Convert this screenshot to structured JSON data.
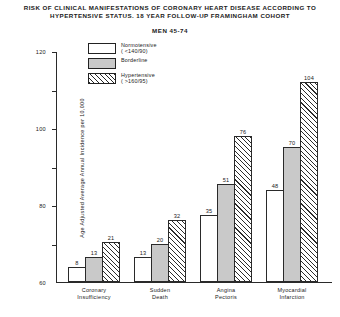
{
  "chart_data": {
    "type": "bar",
    "title": "RISK OF CLINICAL MANIFESTATIONS OF CORONARY HEART DISEASE ACCORDING TO HYPERTENSIVE STATUS.  18 YEAR FOLLOW-UP FRAMINGHAM COHORT",
    "title_line1": "RISK OF CLINICAL MANIFESTATIONS OF CORONARY HEART DISEASE ACCORDING TO",
    "title_line2": "HYPERTENSIVE STATUS.  18 YEAR FOLLOW-UP FRAMINGHAM COHORT",
    "subtitle": "MEN 45-74",
    "xlabel": "",
    "ylabel": "Age Adjusted Average Annual Incidence per 10,000",
    "ylim": [
      0,
      120
    ],
    "yticks": [
      0,
      20,
      40,
      60,
      80,
      100,
      120
    ],
    "ytick_labels": [
      "0",
      "20",
      "40",
      "60",
      "80",
      "100",
      "120"
    ],
    "grid": false,
    "legend_position": "top-left-inside",
    "categories": [
      "Coronary Insufficiency",
      "Sudden Death",
      "Angina Pectoris",
      "Myocardial Infarction"
    ],
    "category_lines": [
      [
        "Coronary",
        "Insufficiency"
      ],
      [
        "Sudden",
        "Death"
      ],
      [
        "Angina",
        "Pectoris"
      ],
      [
        "Myocardial",
        "Infarction"
      ]
    ],
    "series": [
      {
        "name": "Normotensive",
        "detail": "( <140/90)",
        "fill": "white",
        "values": [
          8,
          13,
          35,
          48
        ]
      },
      {
        "name": "Borderline",
        "detail": "",
        "fill": "gray",
        "values": [
          13,
          20,
          51,
          70
        ]
      },
      {
        "name": "Hypertensive",
        "detail": "( >160/95)",
        "fill": "hatched",
        "values": [
          21,
          32,
          76,
          104
        ]
      }
    ]
  },
  "legend": {
    "items": [
      {
        "label": "Normotensive",
        "sub": "( <140/90)"
      },
      {
        "label": "Borderline",
        "sub": ""
      },
      {
        "label": "Hypertensive",
        "sub": "( >160/95)"
      }
    ]
  },
  "colors": {
    "axis": "#2a2a2a",
    "text": "#1a1a1a",
    "bar_normotensive": "#ffffff",
    "bar_borderline": "#c9c9c9",
    "bar_hypertensive": "#ffffff",
    "hatch": "#2b2b2b",
    "background": "#ffffff"
  }
}
